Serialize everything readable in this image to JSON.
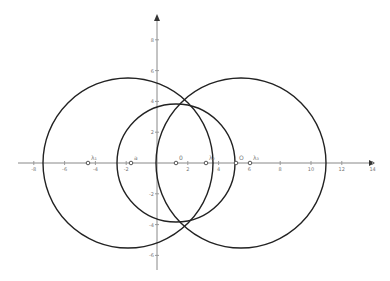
{
  "diagram": {
    "type": "coordinate-geometry",
    "origin_px": [
      157,
      163
    ],
    "unit_px": 15.4,
    "x_ticks": [
      "-8",
      "-6",
      "-4",
      "-2",
      "2",
      "4",
      "6",
      "8",
      "10",
      "12",
      "14"
    ],
    "x_tick_values": [
      -8,
      -6,
      -4,
      -2,
      2,
      4,
      6,
      8,
      10,
      12,
      14
    ],
    "y_ticks": [
      "8",
      "6",
      "4",
      "2",
      "-2",
      "-4",
      "-6"
    ],
    "y_tick_values": [
      8,
      6,
      4,
      2,
      -2,
      -4,
      -6
    ],
    "circles": [
      {
        "name": "left-circle",
        "cx": 128,
        "cy": 163,
        "r": 85
      },
      {
        "name": "right-circle",
        "cx": 241,
        "cy": 163,
        "r": 85
      },
      {
        "name": "middle-circle",
        "cx": 176,
        "cy": 163,
        "r": 59
      }
    ],
    "points": [
      {
        "label": "λ₁",
        "x": 88
      },
      {
        "label": "a",
        "x": 131
      },
      {
        "label": "0",
        "x": 176
      },
      {
        "label": "λ₂",
        "x": 206
      },
      {
        "label": "O",
        "x": 236
      },
      {
        "label": "λ₃",
        "x": 250
      }
    ],
    "colors": {
      "curve": "#222222",
      "axis": "#888888",
      "label": "#777777"
    }
  }
}
